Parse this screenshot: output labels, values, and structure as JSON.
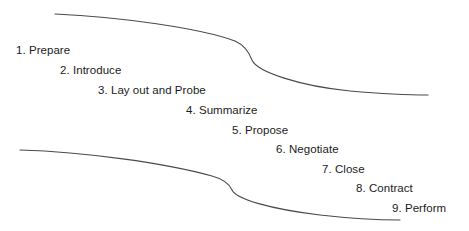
{
  "diagram": {
    "background_color": "#ffffff",
    "curve_color": "#4a4a4a",
    "text_color": "#1b1b1b",
    "width": 469,
    "height": 231,
    "steps": [
      {
        "label": "1. Prepare",
        "x": 16,
        "y": 44
      },
      {
        "label": "2. Introduce",
        "x": 60,
        "y": 64
      },
      {
        "label": "3. Lay out and Probe",
        "x": 98,
        "y": 84
      },
      {
        "label": "4. Summarize",
        "x": 186,
        "y": 104
      },
      {
        "label": "5. Propose",
        "x": 232,
        "y": 124
      },
      {
        "label": "6. Negotiate",
        "x": 276,
        "y": 143
      },
      {
        "label": "7. Close",
        "x": 322,
        "y": 163
      },
      {
        "label": "8. Contract",
        "x": 356,
        "y": 182
      },
      {
        "label": "9. Perform",
        "x": 392,
        "y": 202
      }
    ],
    "curves": [
      {
        "name": "upper-curve",
        "path": "M 55 14 C 120 17, 200 28, 235 41 C 244 45, 249 52, 252 60 C 257 72, 300 86, 350 91 C 385 94, 412 95, 428 95"
      },
      {
        "name": "lower-curve",
        "path": "M 20 150 C 85 152, 165 163, 212 176 C 223 179, 229 183, 232 190 C 236 199, 270 209, 320 215 C 355 219, 385 220, 400 220"
      }
    ]
  }
}
